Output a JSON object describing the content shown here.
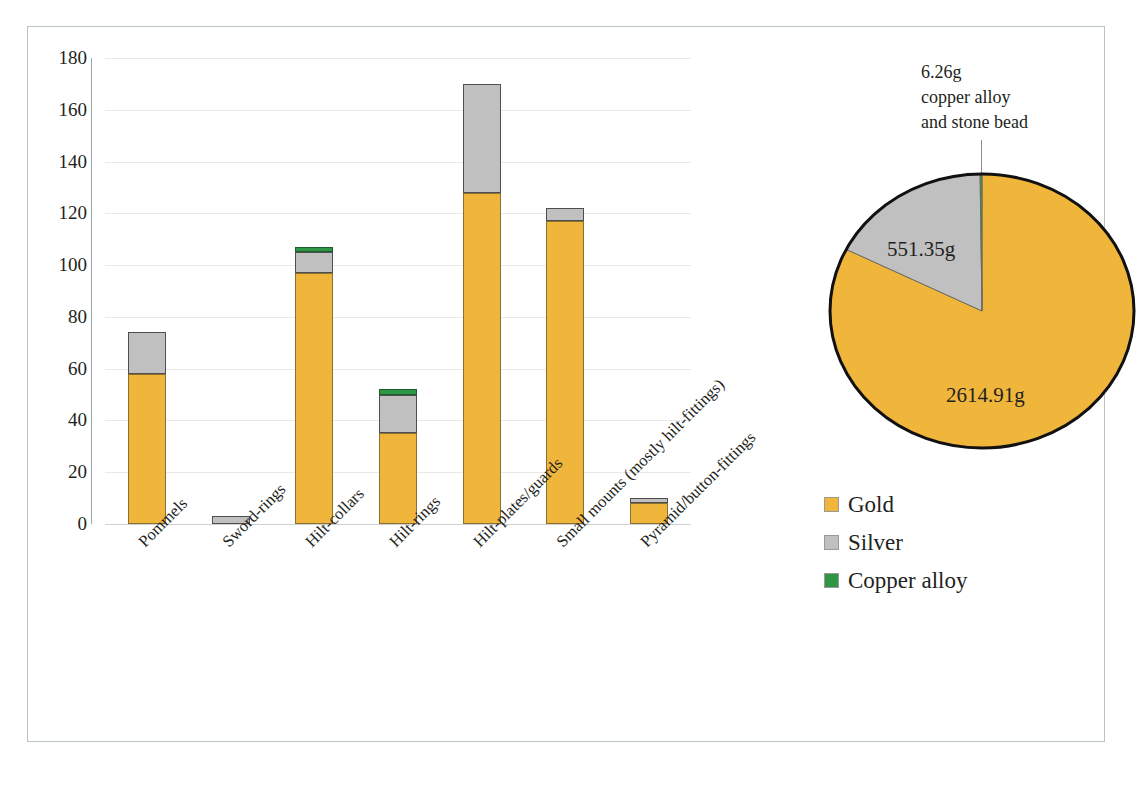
{
  "chart_data": [
    {
      "type": "bar",
      "subtype": "stacked-vertical",
      "title": "",
      "xlabel": "",
      "ylabel": "",
      "ylim": [
        0,
        180
      ],
      "yticks": [
        0,
        20,
        40,
        60,
        80,
        100,
        120,
        140,
        160,
        180
      ],
      "ytick_labels": [
        "0",
        "20",
        "40",
        "60",
        "80",
        "100",
        "120",
        "140",
        "160",
        "180"
      ],
      "grid": true,
      "legend_position": "right",
      "categories": [
        "Pommels",
        "Sword-rings",
        "Hilt-collars",
        "Hilt-rings",
        "Hilt-plates/guards",
        "Small mounts (mostly hilt-fittings)",
        "Pyramid/button-fittings"
      ],
      "series": [
        {
          "name": "Gold",
          "color": "#f0b63c",
          "values": [
            58,
            0,
            97,
            35,
            128,
            117,
            8
          ]
        },
        {
          "name": "Silver",
          "color": "#bfc0bf",
          "values": [
            16,
            3,
            8,
            15,
            42,
            5,
            2
          ]
        },
        {
          "name": "Copper alloy",
          "color": "#2e9644",
          "values": [
            0,
            0,
            2,
            2,
            0,
            0,
            0
          ]
        }
      ],
      "totals": [
        74,
        3,
        107,
        52,
        170,
        122,
        10
      ]
    },
    {
      "type": "pie",
      "title": "",
      "labels": [
        "Gold",
        "Silver",
        "Copper alloy"
      ],
      "values": [
        2614.91,
        551.35,
        6.26
      ],
      "value_labels": [
        "2614.91g",
        "551.35g",
        "6.26g"
      ],
      "colors": [
        "#f0b63c",
        "#bfc0bf",
        "#2e9644"
      ],
      "unit": "g",
      "annotation": "6.26g copper alloy and stone bead",
      "annotation_lines": [
        "6.26g",
        "copper alloy",
        "and stone bead"
      ]
    }
  ],
  "axis": {
    "y_ticks": [
      "180",
      "160",
      "140",
      "120",
      "100",
      "80",
      "60",
      "40",
      "20",
      "0"
    ]
  },
  "categories": [
    {
      "label": "Pommels"
    },
    {
      "label": "Sword-rings"
    },
    {
      "label": "Hilt-collars"
    },
    {
      "label": "Hilt-rings"
    },
    {
      "label": "Hilt-plates/guards"
    },
    {
      "label": "Small mounts (mostly hilt-fittings)"
    },
    {
      "label": "Pyramid/button-fittings"
    }
  ],
  "pie": {
    "annotation": {
      "line1": "6.26g",
      "line2": "copper alloy",
      "line3": "and stone bead"
    },
    "silver_label": "551.35g",
    "gold_label": "2614.91g"
  },
  "legend": {
    "items": [
      {
        "label": "Gold",
        "color": "#f0b63c"
      },
      {
        "label": "Silver",
        "color": "#bfc0bf"
      },
      {
        "label": "Copper alloy",
        "color": "#2e9644"
      }
    ]
  },
  "colors": {
    "gold": "#f0b63c",
    "silver": "#bfc0bf",
    "copper_alloy": "#2e9644",
    "frame": "#b9c4c4",
    "gridline": "#e9e9e9",
    "text": "#231f20"
  }
}
